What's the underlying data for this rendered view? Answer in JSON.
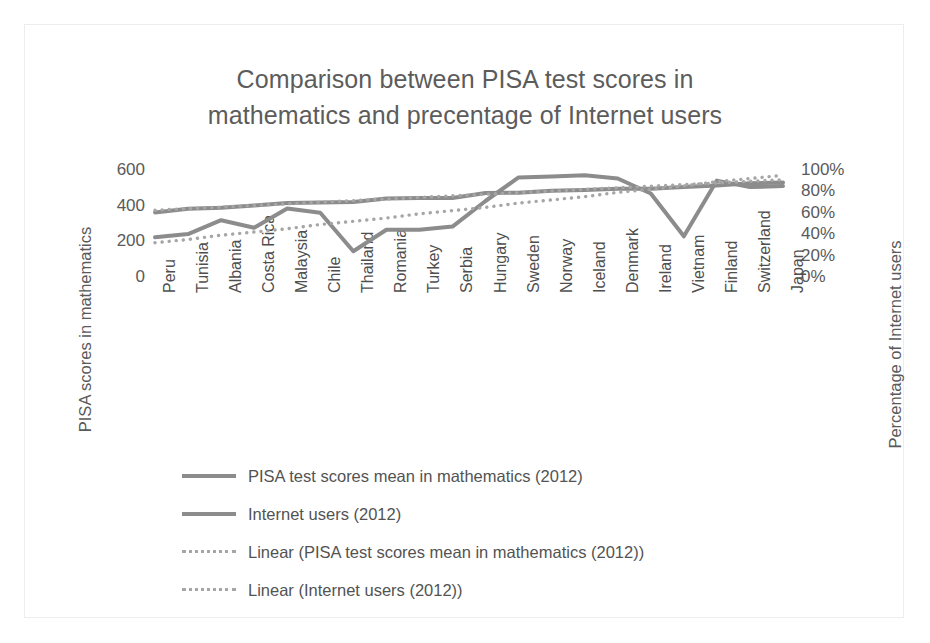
{
  "chart_data": {
    "type": "line",
    "title": "Comparison between PISA test scores in mathematics and precentage of Internet users",
    "title_line1": "Comparison between PISA test scores in",
    "title_line2": "mathematics and precentage of Internet users",
    "xlabel": "",
    "ylabel": "PISA scores in mathematics",
    "y2label": "Percentage of Internet users",
    "ylim": [
      0,
      600
    ],
    "y2lim": [
      0,
      100
    ],
    "grid": false,
    "legend_position": "bottom-left",
    "y_ticks": [
      "600",
      "400",
      "200",
      "0"
    ],
    "y_tick_values": [
      600,
      400,
      200,
      0
    ],
    "y2_ticks": [
      "100%",
      "80%",
      "60%",
      "40%",
      "20%",
      "0%"
    ],
    "y2_tick_values": [
      100,
      80,
      60,
      40,
      20,
      0
    ],
    "categories": [
      "Peru",
      "Tunisia",
      "Albania",
      "Costa Rica",
      "Malaysia",
      "Chile",
      "Thailand",
      "Romania",
      "Turkey",
      "Serbia",
      "Hungary",
      "Sweden",
      "Norway",
      "Iceland",
      "Denmark",
      "Ireland",
      "Vietnam",
      "Finland",
      "Switzerland",
      "Japan"
    ],
    "series": [
      {
        "name": "PISA test scores mean in mathematics (2012)",
        "axis": "left",
        "style": "solid",
        "color": "#8c8c8c",
        "values": [
          368,
          388,
          394,
          407,
          421,
          423,
          427,
          445,
          448,
          449,
          477,
          478,
          489,
          493,
          500,
          501,
          511,
          519,
          531,
          536
        ]
      },
      {
        "name": "Internet users (2012)",
        "axis": "right",
        "style": "solid",
        "color": "#8c8c8c",
        "values": [
          38,
          41,
          54,
          47,
          65,
          61,
          25,
          45,
          45,
          48,
          72,
          94,
          95,
          96,
          93,
          79,
          39,
          91,
          85,
          86
        ]
      },
      {
        "name": "Linear (PISA test scores mean in mathematics (2012))",
        "axis": "left",
        "style": "dotted",
        "color": "#a6a6a6",
        "trendline_of": "PISA test scores mean in mathematics (2012)",
        "values": [
          380,
          389,
          398,
          407,
          416,
          425,
          434,
          443,
          452,
          461,
          470,
          479,
          488,
          497,
          506,
          515,
          524,
          533,
          542,
          551
        ]
      },
      {
        "name": "Linear (Internet users (2012))",
        "axis": "right",
        "style": "dotted",
        "color": "#a6a6a6",
        "trendline_of": "Internet users (2012)",
        "values": [
          33,
          36,
          40,
          43,
          46,
          50,
          53,
          56,
          60,
          63,
          66,
          70,
          73,
          76,
          80,
          83,
          86,
          90,
          93,
          96
        ]
      }
    ],
    "legend": [
      {
        "label": "PISA test scores mean in mathematics (2012)",
        "style": "solid",
        "color": "#8c8c8c"
      },
      {
        "label": "Internet users (2012)",
        "style": "solid",
        "color": "#8c8c8c"
      },
      {
        "label": "Linear (PISA test scores mean in mathematics (2012))",
        "style": "dotted",
        "color": "#a6a6a6"
      },
      {
        "label": "Linear (Internet users (2012))",
        "style": "dotted",
        "color": "#a6a6a6"
      }
    ]
  }
}
